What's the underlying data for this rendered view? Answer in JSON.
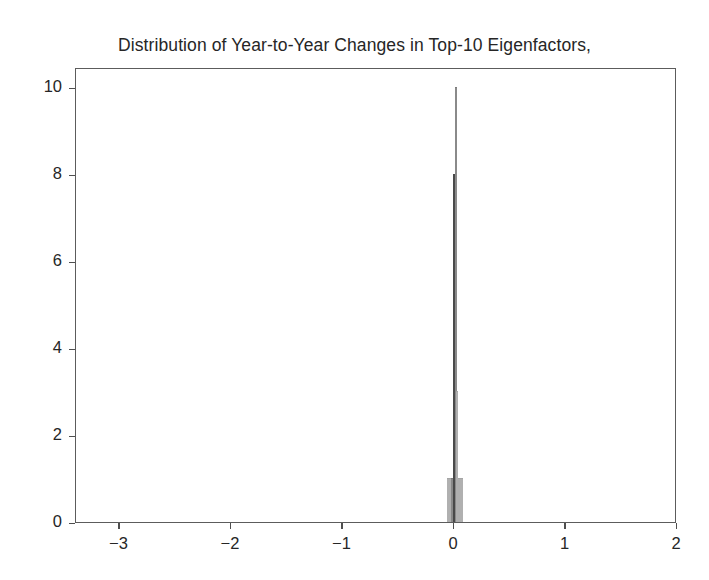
{
  "chart_data": {
    "type": "bar",
    "title": "Distribution of Year-to-Year Changes in Top-10 Eigenfactors, Consumer Defensive",
    "title_lines": [
      "Distribution of Year-to-Year Changes in Top-10 Eigenfactors,",
      "Consumer Defensive"
    ],
    "subtitle": "",
    "xlabel": "",
    "ylabel": "",
    "xlim": [
      -3.39,
      2.0
    ],
    "ylim": [
      0,
      10.45
    ],
    "grid": false,
    "legend": null,
    "xticks": [
      -3,
      -2,
      -1,
      0,
      1,
      2
    ],
    "xticklabels": [
      "−3",
      "−2",
      "−1",
      "0",
      "1",
      "2"
    ],
    "yticks": [
      0,
      2,
      4,
      6,
      8,
      10
    ],
    "yticklabels": [
      "0",
      "2",
      "4",
      "6",
      "8",
      "10"
    ],
    "categories": [
      -0.05,
      -0.035,
      -0.02,
      -0.008,
      0.004,
      0.016,
      0.028,
      0.042,
      0.056,
      0.07
    ],
    "values": [
      1,
      1,
      1,
      1,
      8,
      10,
      3,
      1,
      1,
      1
    ],
    "bin_width": 0.013,
    "bars": [
      {
        "x": -0.052,
        "height": 1,
        "shade": "pale"
      },
      {
        "x": -0.038,
        "height": 1,
        "shade": "pale"
      },
      {
        "x": -0.024,
        "height": 1,
        "shade": "normal"
      },
      {
        "x": -0.01,
        "height": 1,
        "shade": "normal"
      },
      {
        "x": 0.002,
        "height": 8,
        "shade": "dark"
      },
      {
        "x": 0.014,
        "height": 10,
        "shade": "normal"
      },
      {
        "x": 0.026,
        "height": 3,
        "shade": "pale"
      },
      {
        "x": 0.038,
        "height": 1,
        "shade": "pale"
      },
      {
        "x": 0.052,
        "height": 1,
        "shade": "pale"
      },
      {
        "x": 0.066,
        "height": 1,
        "shade": "pale"
      }
    ],
    "colors": {
      "bar_fill": "#d4d4d4",
      "bar_edge": "#6e6e6e",
      "axis": "#5c5c5c",
      "text": "#262626",
      "background": "#ffffff"
    }
  }
}
